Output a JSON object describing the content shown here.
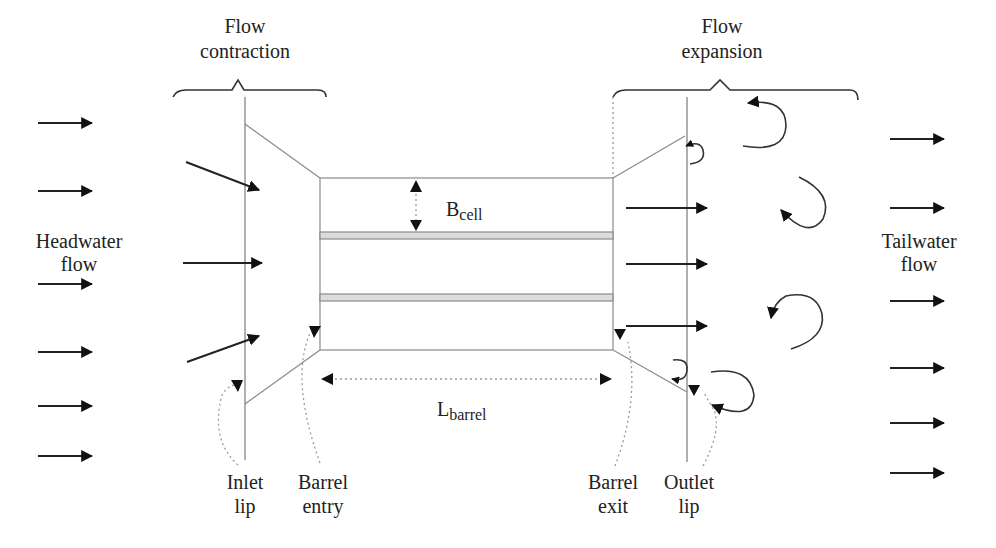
{
  "diagram": {
    "colors": {
      "arrow": "#222222",
      "outline": "#8a8a8a",
      "wall_fill": "#dcdcdc",
      "dotted_leader": "#9a9a9a",
      "text": "#222222"
    },
    "regions": {
      "contraction": {
        "line1": "Flow",
        "line2": "contraction"
      },
      "expansion": {
        "line1": "Flow",
        "line2": "expansion"
      }
    },
    "side_labels": {
      "headwater": {
        "line1": "Headwater",
        "line2": "flow"
      },
      "tailwater": {
        "line1": "Tailwater",
        "line2": "flow"
      }
    },
    "dimensions": {
      "cell_width": {
        "main": "B",
        "sub": "cell"
      },
      "barrel_length": {
        "main": "L",
        "sub": "barrel"
      }
    },
    "callouts": [
      {
        "id": "inlet-lip",
        "line1": "Inlet",
        "line2": "lip"
      },
      {
        "id": "barrel-entry",
        "line1": "Barrel",
        "line2": "entry"
      },
      {
        "id": "barrel-exit",
        "line1": "Barrel",
        "line2": "exit"
      },
      {
        "id": "outlet-lip",
        "line1": "Outlet",
        "line2": "lip"
      }
    ],
    "barrel": {
      "cells": 3,
      "internal_walls": 2
    },
    "headwater_arrows": 6,
    "tailwater_arrows": 6,
    "inlet_arrows": 3,
    "outlet_arrows": 3,
    "eddies": 6
  }
}
